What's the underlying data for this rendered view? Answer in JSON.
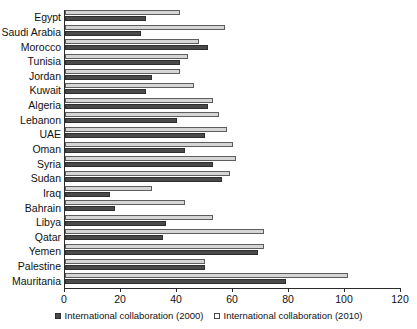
{
  "chart_data": {
    "type": "bar",
    "orientation": "horizontal",
    "title": "",
    "xlabel": "",
    "ylabel": "",
    "xlim": [
      0,
      120
    ],
    "xticks": [
      0,
      20,
      40,
      60,
      80,
      100,
      120
    ],
    "grid": false,
    "legend_position": "bottom",
    "categories": [
      "Egypt",
      "Saudi Arabia",
      "Morocco",
      "Tunisia",
      "Jordan",
      "Kuwait",
      "Algeria",
      "Lebanon",
      "UAE",
      "Oman",
      "Syria",
      "Sudan",
      "Iraq",
      "Bahrain",
      "Libya",
      "Qatar",
      "Yemen",
      "Palestine",
      "Mauritania"
    ],
    "series": [
      {
        "name": "International collaboration (2000)",
        "color": "#4a4a4a",
        "values": [
          29,
          27,
          51,
          41,
          31,
          29,
          51,
          40,
          50,
          43,
          53,
          56,
          16,
          18,
          36,
          35,
          69,
          50,
          79
        ]
      },
      {
        "name": "International collaboration (2010)",
        "color": "#d6d6d6",
        "values": [
          41,
          57,
          48,
          44,
          41,
          46,
          53,
          55,
          58,
          60,
          61,
          59,
          31,
          43,
          53,
          71,
          71,
          50,
          101
        ]
      }
    ]
  },
  "legend": {
    "items": [
      {
        "label": "International collaboration (2000)",
        "marker": "filled-square-icon"
      },
      {
        "label": "International collaboration (2010)",
        "marker": "open-square-icon"
      }
    ]
  }
}
